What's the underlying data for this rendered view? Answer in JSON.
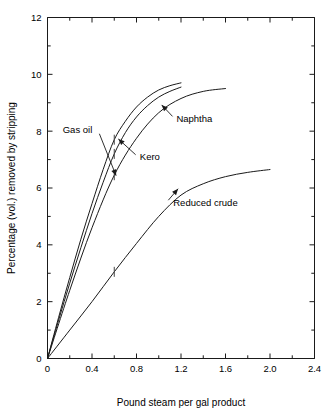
{
  "chart_data": {
    "type": "line",
    "title": "",
    "xlabel": "Pound steam per gal product",
    "ylabel": "Percentage (vol.) removed by stripping",
    "xlim": [
      0,
      2.4
    ],
    "ylim": [
      0,
      12
    ],
    "xticks": [
      "0",
      "0.4",
      "0.8",
      "1.2",
      "1.6",
      "2.0",
      "2.4"
    ],
    "xtick_values": [
      0,
      0.4,
      0.8,
      1.2,
      1.6,
      2.0,
      2.4
    ],
    "xminor_step": 0.2,
    "yticks": [
      "0",
      "2",
      "4",
      "6",
      "8",
      "10",
      "12"
    ],
    "ytick_values": [
      0,
      2,
      4,
      6,
      8,
      10,
      12
    ],
    "yminor_step": 1,
    "grid": false,
    "legend": "annotations-on-curves",
    "series": [
      {
        "name": "Gas oil",
        "x": [
          0.0,
          0.1,
          0.2,
          0.3,
          0.4,
          0.5,
          0.6,
          0.7,
          0.8,
          0.9,
          1.0,
          1.1,
          1.2
        ],
        "y": [
          0.0,
          1.45,
          2.85,
          4.2,
          5.45,
          6.65,
          7.7,
          8.35,
          8.85,
          9.2,
          9.45,
          9.6,
          9.7
        ],
        "marker_x": 0.6,
        "marker_y": 7.7
      },
      {
        "name": "Kero",
        "x": [
          0.0,
          0.1,
          0.2,
          0.3,
          0.4,
          0.5,
          0.6,
          0.7,
          0.8,
          0.9,
          1.0,
          1.1,
          1.2
        ],
        "y": [
          0.0,
          1.35,
          2.65,
          3.9,
          5.1,
          6.2,
          7.2,
          7.95,
          8.5,
          8.9,
          9.2,
          9.4,
          9.55
        ],
        "marker_x": 0.6,
        "marker_y": 7.2
      },
      {
        "name": "Naphtha",
        "x": [
          0.0,
          0.2,
          0.4,
          0.6,
          0.8,
          1.0,
          1.2,
          1.4,
          1.6
        ],
        "y": [
          0.0,
          2.4,
          4.6,
          6.45,
          7.75,
          8.65,
          9.15,
          9.4,
          9.5
        ],
        "marker_x": 0.6,
        "marker_y": 6.45
      },
      {
        "name": "Reduced crude",
        "x": [
          0.0,
          0.2,
          0.4,
          0.6,
          0.8,
          1.0,
          1.2,
          1.4,
          1.6,
          1.8,
          2.0
        ],
        "y": [
          0.0,
          1.0,
          2.0,
          3.05,
          4.05,
          5.0,
          5.75,
          6.15,
          6.4,
          6.55,
          6.65
        ],
        "marker_x": 0.6,
        "marker_y": 3.05
      }
    ],
    "annotations": [
      {
        "label": "Gas oil",
        "text_x": 0.27,
        "text_y": 8.05,
        "target_x": 0.62,
        "target_y": 6.4
      },
      {
        "label": "Kero",
        "text_x": 0.92,
        "text_y": 7.1,
        "target_x": 0.63,
        "target_y": 7.75
      },
      {
        "label": "Naphtha",
        "text_x": 1.32,
        "text_y": 8.45,
        "target_x": 1.02,
        "target_y": 8.95
      },
      {
        "label": "Reduced crude",
        "text_x": 1.42,
        "text_y": 5.5,
        "target_x": 1.18,
        "target_y": 6.0
      }
    ]
  }
}
